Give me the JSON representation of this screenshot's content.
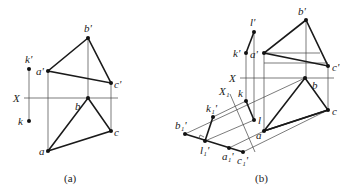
{
  "panel_a": {
    "caption": "(a)",
    "axis_label": "X",
    "labels": {
      "b_prime": "b'",
      "a_prime": "a'",
      "c_prime": "c'",
      "k_prime": "k'",
      "k": "k",
      "b": "b",
      "c": "c",
      "a": "a"
    }
  },
  "panel_b": {
    "caption": "(b)",
    "axis_label": "X",
    "axis1_label": "X₁",
    "labels": {
      "b_prime": "b'",
      "a_prime": "a'",
      "c_prime": "c'",
      "l_prime": "l'",
      "k_prime": "k'",
      "b": "b",
      "c": "c",
      "a": "a",
      "k": "k",
      "l": "l",
      "b1_prime": "b₁'",
      "l1_prime": "l₁'",
      "a1_prime": "a₁'",
      "c1_prime": "c₁'",
      "k1_prime": "k₁'"
    }
  }
}
